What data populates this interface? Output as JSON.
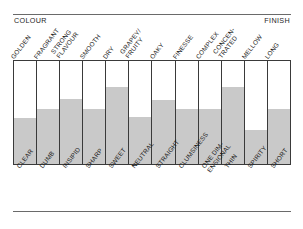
{
  "figure": {
    "header_left": "COLOUR",
    "header_right": "FINISH"
  },
  "chart_data": {
    "type": "bar",
    "title": "",
    "subtitle": "",
    "xlabel": "",
    "ylabel": "",
    "ylim": [
      0,
      100
    ],
    "grid": false,
    "legend": "none",
    "axis_header_left": "COLOUR",
    "axis_header_right": "FINISH",
    "fill_color": "#c9c9c9",
    "frame_color": "#3a3a3a",
    "top_categories": [
      "GOLDEN",
      "FRAGRANT",
      "STRONG FLAVOUR",
      "SMOOTH",
      "DRY",
      "GRAPEY/ FRUITY",
      "OAKY",
      "FINESSE",
      "COMPLEX",
      "CONCEN- TRATED",
      "MELLOW",
      "LONG"
    ],
    "bottom_categories": [
      "CLEAR",
      "DUMB",
      "INSIPID",
      "SHARP",
      "SWEET",
      "NEUTRAL",
      "STRAIGHT",
      "CLUMSINESS",
      "ONE DIM- ENSIONAL",
      "THIN",
      "SPIRITY",
      "SHORT"
    ],
    "values": [
      45,
      53,
      63,
      53,
      75,
      46,
      62,
      53,
      53,
      75,
      33,
      53
    ]
  },
  "top_labels": [
    {
      "l1": "GOLDEN",
      "l2": ""
    },
    {
      "l1": "FRAGRANT",
      "l2": ""
    },
    {
      "l1": "STRONG",
      "l2": "FLAVOUR"
    },
    {
      "l1": "SMOOTH",
      "l2": ""
    },
    {
      "l1": "DRY",
      "l2": ""
    },
    {
      "l1": "GRAPEY/",
      "l2": "FRUITY"
    },
    {
      "l1": "OAKY",
      "l2": ""
    },
    {
      "l1": "FINESSE",
      "l2": ""
    },
    {
      "l1": "COMPLEX",
      "l2": ""
    },
    {
      "l1": "CONCEN-",
      "l2": "TRATED"
    },
    {
      "l1": "MELLOW",
      "l2": ""
    },
    {
      "l1": "LONG",
      "l2": ""
    }
  ],
  "bottom_labels": [
    {
      "l1": "CLEAR",
      "l2": ""
    },
    {
      "l1": "DUMB",
      "l2": ""
    },
    {
      "l1": "INSIPID",
      "l2": ""
    },
    {
      "l1": "SHARP",
      "l2": ""
    },
    {
      "l1": "SWEET",
      "l2": ""
    },
    {
      "l1": "NEUTRAL",
      "l2": ""
    },
    {
      "l1": "STRAIGHT",
      "l2": ""
    },
    {
      "l1": "CLUMSINESS",
      "l2": ""
    },
    {
      "l1": "ONE DIM-",
      "l2": "ENSIONAL"
    },
    {
      "l1": "THIN",
      "l2": ""
    },
    {
      "l1": "SPIRITY",
      "l2": ""
    },
    {
      "l1": "SHORT",
      "l2": ""
    }
  ]
}
